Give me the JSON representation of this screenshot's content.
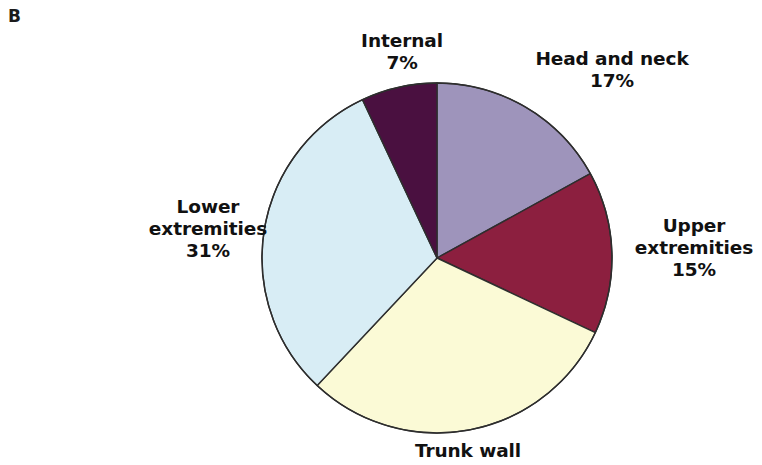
{
  "panel": {
    "label": "B"
  },
  "chart_data": {
    "type": "pie",
    "title": "",
    "subtitle": "",
    "xlabel": "",
    "ylabel": "",
    "legend_position": "none",
    "grid": false,
    "labels_outside": true,
    "start_angle_deg": 0,
    "direction": "clockwise",
    "categories": [
      "Head and neck",
      "Upper extremities",
      "Trunk wall",
      "Lower extremities",
      "Internal"
    ],
    "values": [
      17,
      15,
      30,
      31,
      7
    ],
    "value_suffix": "%",
    "slices": [
      {
        "name": "head-and-neck",
        "label": "Head and neck",
        "value": 17,
        "value_text": "17%",
        "color": "#9e94bb",
        "start_deg": 0,
        "end_deg": 61.2
      },
      {
        "name": "upper-extremities",
        "label_line1": "Upper",
        "label_line2": "extremities",
        "label": "Upper extremities",
        "value": 15,
        "value_text": "15%",
        "color": "#8c1f3f",
        "start_deg": 61.2,
        "end_deg": 115.2
      },
      {
        "name": "trunk-wall",
        "label": "Trunk wall",
        "value": 30,
        "value_text": "",
        "color": "#fbfad6",
        "start_deg": 115.2,
        "end_deg": 223.2
      },
      {
        "name": "lower-extremities",
        "label_line1": "Lower",
        "label_line2": "extremities",
        "label": "Lower extremities",
        "value": 31,
        "value_text": "31%",
        "color": "#d8edf5",
        "start_deg": 223.2,
        "end_deg": 334.8
      },
      {
        "name": "internal",
        "label": "Internal",
        "value": 7,
        "value_text": "7%",
        "color": "#4a1040",
        "start_deg": 334.8,
        "end_deg": 360
      }
    ],
    "stroke_color": "#2e2e2e",
    "stroke_width": 1.4,
    "center_x": 437,
    "center_y": 258,
    "radius": 175
  }
}
